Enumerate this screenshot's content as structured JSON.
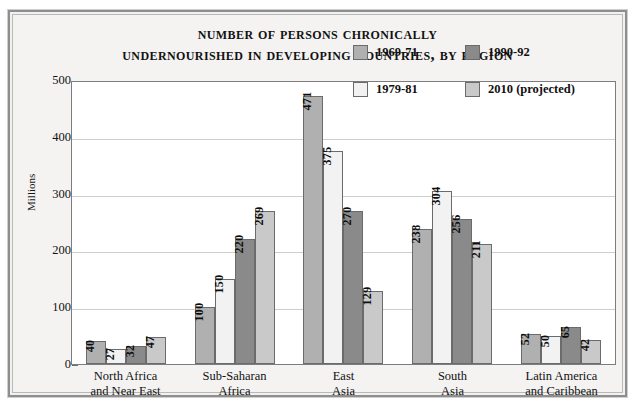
{
  "figure": {
    "title_lines": [
      "Number of Persons Chronically",
      "Undernourished in Developing Countries, by Region"
    ]
  },
  "chart_data": {
    "type": "bar",
    "title": "Number of Persons Chronically Undernourished in Developing Countries, by Region",
    "xlabel": "",
    "ylabel": "Millions",
    "ylim": [
      0,
      500
    ],
    "yticks": [
      0,
      100,
      200,
      300,
      400,
      500
    ],
    "grid": true,
    "legend_position": "upper-center-right",
    "categories": [
      "North Africa\nand Near East",
      "Sub-Saharan\nAfrica",
      "East\nAsia",
      "South\nAsia",
      "Latin America\nand Caribbean"
    ],
    "category_lines": [
      [
        "North Africa",
        "and Near East"
      ],
      [
        "Sub-Saharan",
        "Africa"
      ],
      [
        "East",
        "Asia"
      ],
      [
        "South",
        "Asia"
      ],
      [
        "Latin America",
        "and Caribbean"
      ]
    ],
    "series": [
      {
        "name": "1969-71",
        "color": "#b0b0b0",
        "values": [
          40,
          100,
          471,
          238,
          52
        ]
      },
      {
        "name": "1979-81",
        "color": "#f2f2f2",
        "values": [
          27,
          150,
          375,
          304,
          50
        ]
      },
      {
        "name": "1990-92",
        "color": "#8a8a8a",
        "values": [
          32,
          220,
          270,
          256,
          65
        ]
      },
      {
        "name": "2010 (projected)",
        "color": "#c9c9c9",
        "values": [
          47,
          269,
          129,
          211,
          42
        ]
      }
    ],
    "legend_order": [
      "1969-71",
      "1990-92",
      "1979-81",
      "2010 (projected)"
    ]
  }
}
